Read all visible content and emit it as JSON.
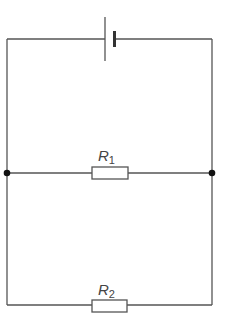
{
  "diagram": {
    "type": "circuit",
    "colors": {
      "wire": "#555555",
      "background": "#ffffff"
    },
    "components": [
      {
        "id": "battery",
        "kind": "cell"
      },
      {
        "id": "R1",
        "kind": "resistor",
        "label_main": "R",
        "label_sub": "1"
      },
      {
        "id": "R2",
        "kind": "resistor",
        "label_main": "R",
        "label_sub": "2"
      }
    ],
    "junctions": [
      {
        "id": "left-junction"
      },
      {
        "id": "right-junction"
      }
    ]
  }
}
